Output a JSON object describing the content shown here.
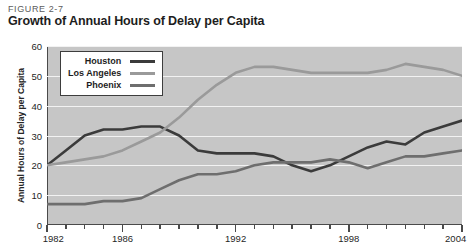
{
  "header": {
    "figure_number": "FIGURE 2-7",
    "title": "Growth of Annual Hours of Delay per Capita"
  },
  "legend": {
    "position": "top-left inside plot",
    "items": [
      {
        "label": "Houston",
        "color": "#3b3b3b"
      },
      {
        "label": "Los Angeles",
        "color": "#9a9a9a"
      },
      {
        "label": "Phoenix",
        "color": "#6e6e6e"
      }
    ]
  },
  "axes": {
    "y_title": "Annual Hours of Delay per Capita",
    "y_ticks": [
      "0",
      "10",
      "20",
      "30",
      "40",
      "50",
      "60"
    ],
    "x_ticks_labeled": [
      "1982",
      "1986",
      "1992",
      "1998",
      "2004"
    ]
  },
  "colors": {
    "plot_background": "#c6c6c6",
    "gridline": "#f2f2f2",
    "axis": "#4a4a4a",
    "page_background": "#ffffff",
    "title_text": "#1d1d1d",
    "figure_number_text": "#5c5c5c"
  },
  "chart_data": {
    "type": "line",
    "title": "Growth of Annual Hours of Delay per Capita",
    "subtitle": "FIGURE 2-7",
    "xlabel": "",
    "ylabel": "Annual Hours of Delay per Capita",
    "xlim": [
      1982,
      2004
    ],
    "ylim": [
      0,
      60
    ],
    "y_ticks": [
      0,
      10,
      20,
      30,
      40,
      50,
      60
    ],
    "x_ticks": [
      1982,
      1986,
      1992,
      1998,
      2004
    ],
    "grid": true,
    "legend_position": "upper left",
    "x": [
      1982,
      1983,
      1984,
      1985,
      1986,
      1987,
      1988,
      1989,
      1990,
      1991,
      1992,
      1993,
      1994,
      1995,
      1996,
      1997,
      1998,
      1999,
      2000,
      2001,
      2002,
      2003,
      2004
    ],
    "series": [
      {
        "name": "Houston",
        "color": "#3b3b3b",
        "values": [
          20,
          25,
          30,
          32,
          32,
          33,
          33,
          30,
          25,
          24,
          24,
          24,
          23,
          20,
          18,
          20,
          23,
          26,
          28,
          27,
          31,
          33,
          35
        ]
      },
      {
        "name": "Los Angeles",
        "color": "#9a9a9a",
        "values": [
          20,
          21,
          22,
          23,
          25,
          28,
          31,
          36,
          42,
          47,
          51,
          53,
          53,
          52,
          51,
          51,
          51,
          51,
          52,
          54,
          53,
          52,
          50
        ]
      },
      {
        "name": "Phoenix",
        "color": "#6e6e6e",
        "values": [
          7,
          7,
          7,
          8,
          8,
          9,
          12,
          15,
          17,
          17,
          18,
          20,
          21,
          21,
          21,
          22,
          21,
          19,
          21,
          23,
          23,
          24,
          25
        ]
      }
    ]
  }
}
